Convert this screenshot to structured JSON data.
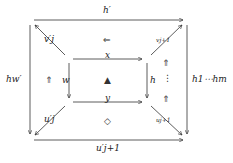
{
  "diagram": {
    "labels": {
      "top": "h′",
      "bottom": "u′j+1",
      "left": "hw′",
      "right": "h1⋯hm",
      "inner_top": "x",
      "inner_bottom": "y",
      "inner_left": "w",
      "inner_right": "h",
      "diag_top_left": "v′j",
      "diag_top_right": "vj+1",
      "diag_bottom_left": "u′j",
      "diag_bottom_right": "uj+1"
    },
    "symbols": {
      "top_cell": "⇐",
      "left_cell": "⇑",
      "center": "▲",
      "bottom_cell": "◇",
      "right_up_top": "⇑",
      "right_dots": "⋮",
      "right_up_bottom": "⇑"
    },
    "colors": {
      "stroke": "#333333"
    }
  }
}
